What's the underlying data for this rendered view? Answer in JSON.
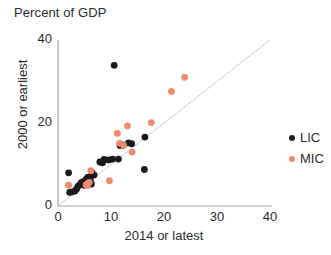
{
  "chart_data": {
    "type": "scatter",
    "title": "Percent of GDP",
    "xlabel": "2014 or latest",
    "ylabel": "2000 or earliest",
    "xlim": [
      0,
      40
    ],
    "ylim": [
      0,
      40
    ],
    "xticks": [
      "0",
      "10",
      "20",
      "30",
      "40"
    ],
    "yticks": [
      "0",
      "20",
      "40"
    ],
    "grid": false,
    "legend_position": "right",
    "reference_line": {
      "name": "45-degree-line",
      "from": [
        0,
        0
      ],
      "to": [
        40,
        40
      ],
      "color": "#a9a9a9"
    },
    "colors": {
      "LIC": "#1a1a1a",
      "MIC": "#f08a6c"
    },
    "series": [
      {
        "name": "LIC",
        "label": "LIC",
        "color": "#1a1a1a",
        "points": [
          [
            10.6,
            33.9
          ],
          [
            16.4,
            16.6
          ],
          [
            13.3,
            15.2
          ],
          [
            13.9,
            15.0
          ],
          [
            12.2,
            14.7
          ],
          [
            11.7,
            14.6
          ],
          [
            10.3,
            11.3
          ],
          [
            11.4,
            11.3
          ],
          [
            8.7,
            11.2
          ],
          [
            9.6,
            11.1
          ],
          [
            7.9,
            10.6
          ],
          [
            8.4,
            10.4
          ],
          [
            16.3,
            8.8
          ],
          [
            2.0,
            8.0
          ],
          [
            6.4,
            8.1
          ],
          [
            6.8,
            7.5
          ],
          [
            6.0,
            7.0
          ],
          [
            5.6,
            6.9
          ],
          [
            5.3,
            6.4
          ],
          [
            6.1,
            6.2
          ],
          [
            5.1,
            5.9
          ],
          [
            4.7,
            5.8
          ],
          [
            4.4,
            5.6
          ],
          [
            5.8,
            5.5
          ],
          [
            6.3,
            5.3
          ],
          [
            4.2,
            5.2
          ],
          [
            5.0,
            5.0
          ],
          [
            3.8,
            4.8
          ],
          [
            3.2,
            3.6
          ],
          [
            2.6,
            3.4
          ],
          [
            2.2,
            3.3
          ],
          [
            3.5,
            4.1
          ]
        ]
      },
      {
        "name": "MIC",
        "label": "MIC",
        "color": "#f08a6c",
        "points": [
          [
            23.9,
            31.0
          ],
          [
            21.4,
            27.6
          ],
          [
            17.6,
            20.1
          ],
          [
            13.1,
            19.3
          ],
          [
            11.2,
            17.5
          ],
          [
            11.6,
            15.1
          ],
          [
            12.4,
            14.6
          ],
          [
            14.0,
            13.0
          ],
          [
            6.2,
            8.5
          ],
          [
            9.7,
            6.1
          ],
          [
            5.6,
            5.4
          ],
          [
            5.3,
            5.1
          ],
          [
            5.5,
            4.9
          ],
          [
            2.0,
            5.0
          ],
          [
            5.9,
            5.7
          ]
        ]
      }
    ]
  },
  "legend": {
    "items": [
      {
        "label": "LIC",
        "color": "#1a1a1a"
      },
      {
        "label": "MIC",
        "color": "#f08a6c"
      }
    ]
  }
}
